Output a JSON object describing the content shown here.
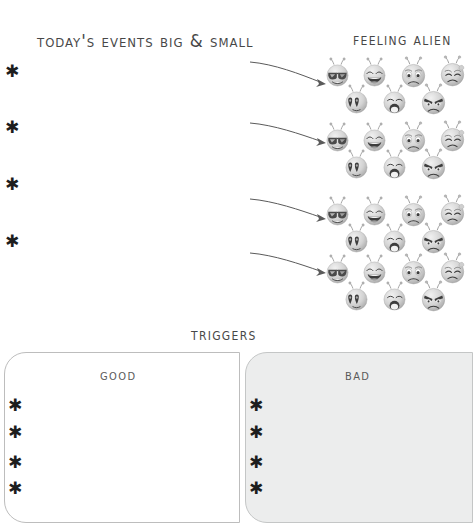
{
  "page": {
    "background_color": "#ffffff",
    "ink_color": "#3a3a3a"
  },
  "sections": {
    "events": {
      "title": "Today's Events Big & Small",
      "bullets": [
        {
          "marker": "✱",
          "text": ""
        },
        {
          "marker": "✱",
          "text": ""
        },
        {
          "marker": "✱",
          "text": ""
        },
        {
          "marker": "✱",
          "text": ""
        }
      ]
    },
    "feeling": {
      "title": "Feeling alien",
      "rows": [
        {
          "faces": [
            {
              "name": "sunglasses-alien-face",
              "expression": "cool-sunglasses"
            },
            {
              "name": "laughing-alien-face",
              "expression": "laughing"
            },
            {
              "name": "worried-alien-face",
              "expression": "worried"
            },
            {
              "name": "crying-alien-face",
              "expression": "crying"
            },
            {
              "name": "heart-eyes-alien-face",
              "expression": "heart-eyes"
            },
            {
              "name": "shocked-alien-face",
              "expression": "shocked"
            },
            {
              "name": "angry-alien-face",
              "expression": "angry"
            }
          ]
        },
        {
          "faces": [
            {
              "name": "sunglasses-alien-face",
              "expression": "cool-sunglasses"
            },
            {
              "name": "laughing-alien-face",
              "expression": "laughing"
            },
            {
              "name": "worried-alien-face",
              "expression": "worried"
            },
            {
              "name": "crying-alien-face",
              "expression": "crying"
            },
            {
              "name": "heart-eyes-alien-face",
              "expression": "heart-eyes"
            },
            {
              "name": "shocked-alien-face",
              "expression": "shocked"
            },
            {
              "name": "angry-alien-face",
              "expression": "angry"
            }
          ]
        },
        {
          "faces": [
            {
              "name": "sunglasses-alien-face",
              "expression": "cool-sunglasses"
            },
            {
              "name": "laughing-alien-face",
              "expression": "laughing"
            },
            {
              "name": "worried-alien-face",
              "expression": "worried"
            },
            {
              "name": "crying-alien-face",
              "expression": "crying"
            },
            {
              "name": "heart-eyes-alien-face",
              "expression": "heart-eyes"
            },
            {
              "name": "shocked-alien-face",
              "expression": "shocked"
            },
            {
              "name": "angry-alien-face",
              "expression": "angry"
            }
          ]
        },
        {
          "faces": [
            {
              "name": "sunglasses-alien-face",
              "expression": "cool-sunglasses"
            },
            {
              "name": "laughing-alien-face",
              "expression": "laughing"
            },
            {
              "name": "worried-alien-face",
              "expression": "worried"
            },
            {
              "name": "crying-alien-face",
              "expression": "crying"
            },
            {
              "name": "heart-eyes-alien-face",
              "expression": "heart-eyes"
            },
            {
              "name": "shocked-alien-face",
              "expression": "shocked"
            },
            {
              "name": "angry-alien-face",
              "expression": "angry"
            }
          ]
        }
      ]
    },
    "triggers": {
      "title": "Triggers",
      "good": {
        "heading": "Good",
        "fill_color": "#ffffff",
        "bullets": [
          {
            "marker": "✱",
            "text": ""
          },
          {
            "marker": "✱",
            "text": ""
          },
          {
            "marker": "✱",
            "text": ""
          },
          {
            "marker": "✱",
            "text": ""
          }
        ]
      },
      "bad": {
        "heading": "Bad",
        "fill_color": "#eceded",
        "bullets": [
          {
            "marker": "✱",
            "text": ""
          },
          {
            "marker": "✱",
            "text": ""
          },
          {
            "marker": "✱",
            "text": ""
          },
          {
            "marker": "✱",
            "text": ""
          }
        ]
      }
    }
  }
}
